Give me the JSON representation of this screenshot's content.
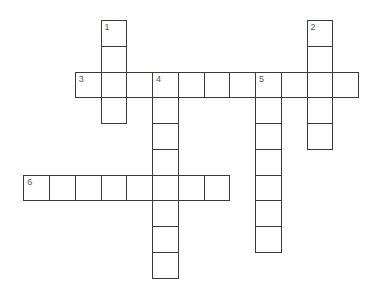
{
  "puzzle": {
    "words": [
      {
        "number": "1",
        "direction": "down",
        "row": 0,
        "col": 3,
        "length": 4,
        "answer": ""
      },
      {
        "number": "2",
        "direction": "down",
        "row": 0,
        "col": 11,
        "length": 5,
        "answer": ""
      },
      {
        "number": "3",
        "direction": "across",
        "row": 2,
        "col": 2,
        "length": 11,
        "answer": ""
      },
      {
        "number": "4",
        "direction": "down",
        "row": 2,
        "col": 5,
        "length": 8,
        "answer": ""
      },
      {
        "number": "5",
        "direction": "down",
        "row": 2,
        "col": 9,
        "length": 7,
        "answer": ""
      },
      {
        "number": "6",
        "direction": "across",
        "row": 6,
        "col": 0,
        "length": 8,
        "answer": ""
      }
    ]
  },
  "colors": {
    "border": "#3a3a3a",
    "number": "#555555",
    "background": "#ffffff"
  }
}
